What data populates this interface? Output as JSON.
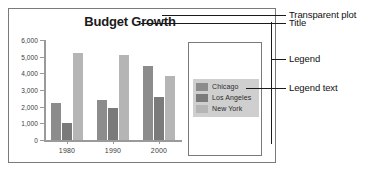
{
  "chart_data": {
    "type": "bar",
    "title": "Budget Growth",
    "xlabel": "",
    "ylabel": "",
    "categories": [
      "1980",
      "1990",
      "2000"
    ],
    "series": [
      {
        "name": "Chicago",
        "values": [
          2200,
          2400,
          4450
        ],
        "color": "#8c8c8c"
      },
      {
        "name": "Los Angeles",
        "values": [
          1050,
          1900,
          2600
        ],
        "color": "#7a7a7a"
      },
      {
        "name": "New York",
        "values": [
          5250,
          5100,
          3850
        ],
        "color": "#b5b5b5"
      }
    ],
    "ylim": [
      0,
      6000
    ],
    "yticks": [
      0,
      1000,
      2000,
      3000,
      4000,
      5000,
      6000
    ],
    "ytick_labels": [
      "0",
      "1,000",
      "2,000",
      "3,000",
      "4,000",
      "5,000",
      "6,000"
    ],
    "grid": false,
    "legend_position": "right"
  },
  "legend": {
    "entries": [
      {
        "label": "Chicago",
        "color": "#8c8c8c"
      },
      {
        "label": "Los Angeles",
        "color": "#7a7a7a"
      },
      {
        "label": "New York",
        "color": "#b5b5b5"
      }
    ]
  },
  "annotations": [
    {
      "label": "Transparent plot"
    },
    {
      "label": "Title"
    },
    {
      "label": "Legend"
    },
    {
      "label": "Legend text"
    }
  ],
  "colors": {
    "frame": "#7a7a7a",
    "axis": "#9a9a9a",
    "legend_panel": "#cfcfcf",
    "text": "#1a1a1a"
  }
}
